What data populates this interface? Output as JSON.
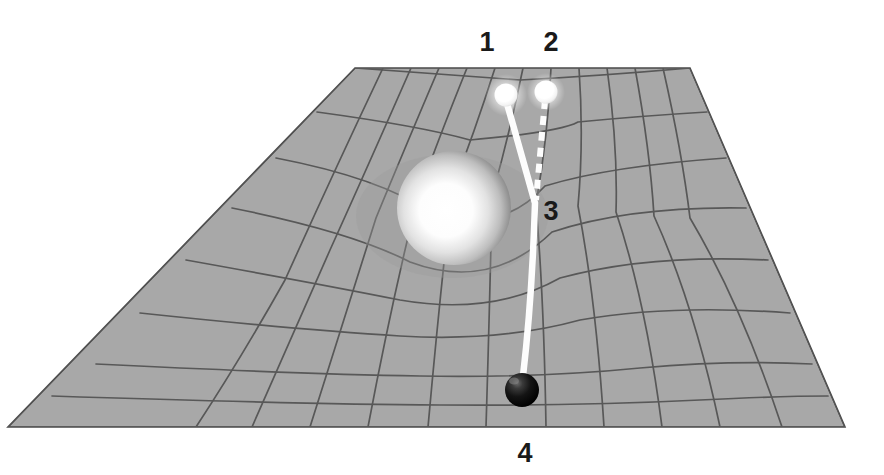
{
  "figure": {
    "background_color": "#ffffff",
    "width": 884,
    "height": 475
  },
  "labels": [
    {
      "id": "1",
      "text": "1",
      "refers_to": "apparent-image-source-sphere",
      "x": 487,
      "y": 43
    },
    {
      "id": "2",
      "text": "2",
      "refers_to": "true-source-sphere",
      "x": 551,
      "y": 43
    },
    {
      "id": "3",
      "text": "3",
      "refers_to": "light-deflection-bend-point",
      "x": 548,
      "y": 212
    },
    {
      "id": "4",
      "text": "4",
      "refers_to": "observer-sphere",
      "x": 525,
      "y": 455
    }
  ],
  "colors": {
    "grid_fill": "#a8a8a8",
    "grid_line": "#585858",
    "grid_edge": "#4a4a4a",
    "ray_solid": "#fdfdfd",
    "ray_dashed": "#fdfdfd",
    "massive_body_core": "#ffffff",
    "massive_body_rim": "#6e6e6e",
    "source_sphere": "#ffffff",
    "observer_sphere": "#0d0d0d",
    "label_text": "#1a1a1a"
  },
  "objects": {
    "spacetime_grid": {
      "name": "spacetime-grid",
      "shape": "trapezoid-perspective-plane",
      "top_edge": {
        "left_x": 355,
        "right_x": 690,
        "y": 68
      },
      "bottom_edge": {
        "left_x": 8,
        "right_x": 845,
        "y": 427
      },
      "columns": 12,
      "rows": 9,
      "curvature": "depressed funnel around massive body"
    },
    "massive_body": {
      "name": "massive-body-sphere",
      "center_x": 454,
      "center_y": 208,
      "radius": 57,
      "highlight_x": 446,
      "highlight_y": 214
    },
    "source_sphere_1": {
      "name": "apparent-image-sphere",
      "center_x": 506,
      "center_y": 95,
      "radius": 11
    },
    "source_sphere_2": {
      "name": "true-source-sphere",
      "center_x": 546,
      "center_y": 92,
      "radius": 11
    },
    "observer_sphere": {
      "name": "observer-sphere",
      "center_x": 522,
      "center_y": 390,
      "radius": 17
    },
    "light_ray_deflected": {
      "name": "deflected-light-ray",
      "style": "solid",
      "width": 6,
      "path": "from apparent image sphere 1 down to bend point 3 then to observer 4"
    },
    "light_ray_straight": {
      "name": "straight-line-of-sight-ray",
      "style": "dashed",
      "width": 6,
      "dash": "9 7",
      "path": "from true source sphere 2 straight down to bend point 3"
    }
  }
}
